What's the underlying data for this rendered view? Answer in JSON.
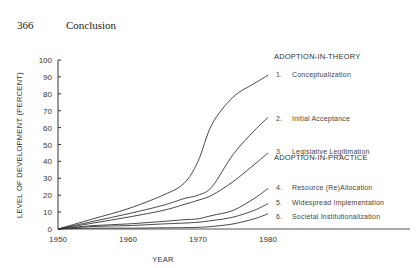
{
  "page": {
    "number": "366",
    "title": "Conclusion"
  },
  "chart_data": {
    "type": "line",
    "title": "",
    "xlabel": "YEAR",
    "ylabel": "LEVEL OF DEVELOPMENT (PERCENT)",
    "xlim": [
      1950,
      1980
    ],
    "ylim": [
      0,
      100
    ],
    "x_ticks": [
      "1950",
      "1960",
      "1970",
      "1980"
    ],
    "y_ticks": [
      "0",
      "10",
      "20",
      "30",
      "40",
      "50",
      "60",
      "70",
      "80",
      "90",
      "100"
    ],
    "grid": false,
    "legend_position": "right, labels at curve ends",
    "legend_groups": [
      {
        "heading": "ADOPTION-IN-THEORY",
        "items": [
          "1.",
          "2.",
          "3."
        ]
      },
      {
        "heading": "ADOPTION-IN-PRACTICE",
        "items": [
          "4.",
          "5.",
          "6."
        ]
      }
    ],
    "x": [
      1950,
      1955,
      1960,
      1965,
      1968,
      1970,
      1972,
      1975,
      1978,
      1980
    ],
    "series": [
      {
        "number": "1.",
        "name": "Conceptualization",
        "values": [
          0,
          6,
          12,
          20,
          27,
          40,
          62,
          78,
          86,
          91
        ]
      },
      {
        "number": "2.",
        "name": "Initial Acceptance",
        "values": [
          0,
          4.5,
          9,
          14,
          18,
          20,
          25,
          44,
          58,
          66
        ]
      },
      {
        "number": "3.",
        "name": "Legislative Legitimation",
        "values": [
          0,
          3.5,
          7,
          11,
          14.5,
          17,
          20,
          28,
          38,
          45
        ]
      },
      {
        "number": "4.",
        "name": "Resource (Re)Allocation",
        "values": [
          0,
          2,
          3,
          4.5,
          5.5,
          6,
          8,
          11,
          18,
          24
        ]
      },
      {
        "number": "5.",
        "name": "Widespread Implementation",
        "values": [
          0,
          1.5,
          2,
          3,
          3.5,
          4,
          5,
          7,
          11,
          15
        ]
      },
      {
        "number": "6.",
        "name": "Societal Institutionalization",
        "values": [
          0,
          0.5,
          0.5,
          0.7,
          0.8,
          1,
          1.5,
          3,
          6,
          9
        ]
      }
    ]
  }
}
